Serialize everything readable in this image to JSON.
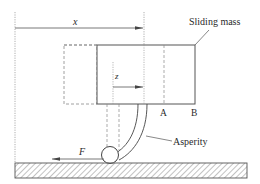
{
  "diagram": {
    "labels": {
      "x": "x",
      "z": "z",
      "sliding_mass": "Sliding mass",
      "point_a": "A",
      "point_b": "B",
      "asperity": "Asperity",
      "force": "F"
    },
    "colors": {
      "stroke": "#555555",
      "text": "#2a2a2a",
      "hatch": "#777777",
      "background": "#ffffff"
    }
  }
}
